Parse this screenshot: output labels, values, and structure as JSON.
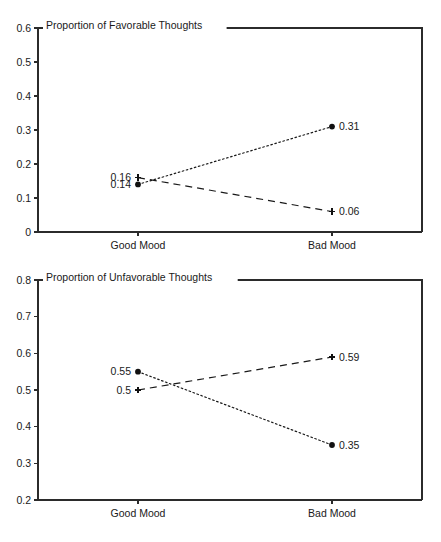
{
  "figure": {
    "caption_fragment": ""
  },
  "chart_data": [
    {
      "type": "line",
      "id": "favorable",
      "title": "Proportion of Favorable Thoughts",
      "xlabel": "",
      "ylabel": "",
      "categories": [
        "Good Mood",
        "Bad Mood"
      ],
      "ylim": [
        0,
        0.6
      ],
      "yticks": [
        "0",
        "0.1",
        "0.2",
        "0.3",
        "0.4",
        "0.5",
        "0.6"
      ],
      "ytick_values": [
        0,
        0.1,
        0.2,
        0.3,
        0.4,
        0.5,
        0.6
      ],
      "grid": false,
      "legend": "none",
      "series": [
        {
          "name": "dotted-circle-series",
          "marker": "circle",
          "linestyle": "dotted",
          "values": [
            0.14,
            0.31
          ],
          "labels": [
            "0.14",
            "0.31"
          ],
          "label_positions": [
            "left",
            "right"
          ]
        },
        {
          "name": "dashed-plus-series",
          "marker": "plus",
          "linestyle": "dashed",
          "values": [
            0.16,
            0.06
          ],
          "labels": [
            "0.16",
            "0.06"
          ],
          "label_positions": [
            "left",
            "right"
          ]
        }
      ]
    },
    {
      "type": "line",
      "id": "unfavorable",
      "title": "Proportion of Unfavorable Thoughts",
      "xlabel": "",
      "ylabel": "",
      "categories": [
        "Good Mood",
        "Bad Mood"
      ],
      "ylim": [
        0.2,
        0.8
      ],
      "yticks": [
        "0.2",
        "0.3",
        "0.4",
        "0.5",
        "0.6",
        "0.7",
        "0.8"
      ],
      "ytick_values": [
        0.2,
        0.3,
        0.4,
        0.5,
        0.6,
        0.7,
        0.8
      ],
      "grid": false,
      "legend": "none",
      "series": [
        {
          "name": "dotted-circle-series",
          "marker": "circle",
          "linestyle": "dotted",
          "values": [
            0.55,
            0.35
          ],
          "labels": [
            "0.55",
            "0.35"
          ],
          "label_positions": [
            "left",
            "right"
          ]
        },
        {
          "name": "dashed-plus-series",
          "marker": "plus",
          "linestyle": "dashed",
          "values": [
            0.5,
            0.59
          ],
          "labels": [
            "0.5",
            "0.59"
          ],
          "label_positions": [
            "left",
            "right"
          ]
        }
      ]
    }
  ]
}
